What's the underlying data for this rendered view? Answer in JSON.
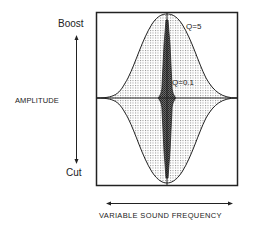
{
  "diagram": {
    "type": "equalizer-bandwidth-diagram",
    "y_axis": {
      "label": "AMPLITUDE",
      "top_label": "Boost",
      "bottom_label": "Cut"
    },
    "x_axis": {
      "label": "VARIABLE SOUND FREQUENCY"
    },
    "curves": [
      {
        "name": "wide-band",
        "label": "Q=5",
        "fill": "light-dotted"
      },
      {
        "name": "narrow-band",
        "label": "Q=0.1",
        "fill": "dark-dotted"
      }
    ],
    "colors": {
      "line": "#222222",
      "wide_fill_dot": "#8a8a8a",
      "narrow_fill_dot": "#333333",
      "background": "#ffffff"
    }
  }
}
